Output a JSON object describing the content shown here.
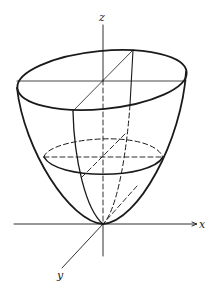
{
  "figure": {
    "axes": {
      "x_label": "x",
      "y_label": "y",
      "z_label": "z"
    },
    "colors": {
      "line": "#1a1a1a",
      "background": "#ffffff"
    }
  }
}
